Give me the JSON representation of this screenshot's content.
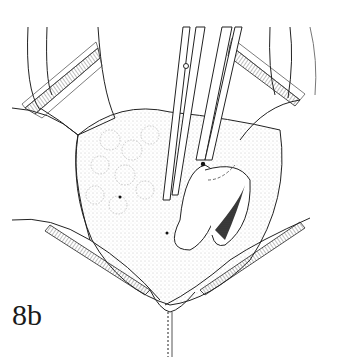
{
  "figure": {
    "label": "8b",
    "colors": {
      "ink": "#1a1a1a",
      "stipple": "#9a9a9a",
      "background": "#ffffff",
      "shadow": "#2b2b2b"
    }
  }
}
